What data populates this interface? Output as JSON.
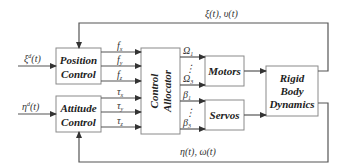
{
  "diagram": {
    "type": "block-diagram",
    "blocks": {
      "position_control": {
        "line1": "Position",
        "line2": "Control"
      },
      "attitude_control": {
        "line1": "Attitude",
        "line2": "Control"
      },
      "control_allocator": {
        "line1": "Control",
        "line2": "Allocator"
      },
      "motors": {
        "label": "Motors"
      },
      "servos": {
        "label": "Servos"
      },
      "rigid_body": {
        "line1": "Rigid",
        "line2": "Body",
        "line3": "Dynamics"
      }
    },
    "inputs": {
      "xi_d": "ξ",
      "xi_d_sup": "d",
      "xi_d_arg": "(t)",
      "eta_d": "η",
      "eta_d_sup": "d",
      "eta_d_arg": "(t)"
    },
    "forces": [
      {
        "sym": "f",
        "sub": "x"
      },
      {
        "sym": "f",
        "sub": "y"
      },
      {
        "sym": "f",
        "sub": "z"
      }
    ],
    "torques": [
      {
        "sym": "τ",
        "sub": "x"
      },
      {
        "sym": "τ",
        "sub": "y"
      },
      {
        "sym": "τ",
        "sub": "z"
      }
    ],
    "motor_signals": {
      "first": {
        "sym": "Ω",
        "sub": "1"
      },
      "dots": "⋮",
      "last": {
        "sym": "Ω",
        "sub": "3"
      }
    },
    "servo_signals": {
      "first": {
        "sym": "β",
        "sub": "1"
      },
      "dots": "⋮",
      "last": {
        "sym": "β",
        "sub": "3"
      }
    },
    "feedback": {
      "top": "ξ(t),  υ(t)",
      "bottom": "η(t),  ω(t)"
    }
  }
}
